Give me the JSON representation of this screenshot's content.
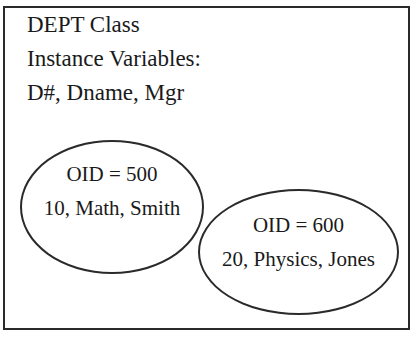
{
  "class_box": {
    "title": "DEPT Class",
    "subtitle": "Instance Variables:",
    "variables": "D#, Dname, Mgr"
  },
  "objects": [
    {
      "oid_label": "OID = 500",
      "values": "10, Math, Smith"
    },
    {
      "oid_label": "OID = 600",
      "values": "20, Physics, Jones"
    }
  ]
}
